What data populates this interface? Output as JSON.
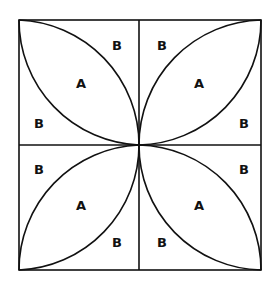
{
  "diagram": {
    "type": "quilt-block",
    "stroke_color": "#111111",
    "background": "#ffffff",
    "outer_square": {
      "x1": 19,
      "y1": 20,
      "x2": 261,
      "y2": 270
    },
    "center": {
      "x": 139,
      "y": 145
    },
    "quadrants": [
      {
        "name": "top-left",
        "labels": {
          "a": "A",
          "b1": "B",
          "b2": "B"
        }
      },
      {
        "name": "top-right",
        "labels": {
          "a": "A",
          "b1": "B",
          "b2": "B"
        }
      },
      {
        "name": "bottom-left",
        "labels": {
          "a": "A",
          "b1": "B",
          "b2": "B"
        }
      },
      {
        "name": "bottom-right",
        "labels": {
          "a": "A",
          "b1": "B",
          "b2": "B"
        }
      }
    ]
  }
}
